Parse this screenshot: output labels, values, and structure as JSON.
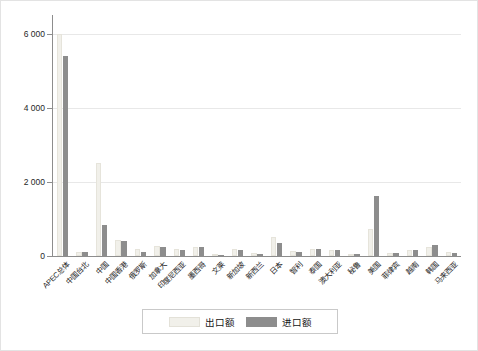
{
  "chart_data": {
    "type": "bar",
    "title": "",
    "xlabel": "",
    "ylabel": "",
    "ylim": [
      0,
      6400
    ],
    "yticks": [
      0,
      2000,
      4000,
      6000
    ],
    "ytick_labels": [
      "0",
      "2 000",
      "4 000",
      "6 000"
    ],
    "grid": true,
    "legend_position": "bottom",
    "categories": [
      "APEC总体",
      "中国台北",
      "中国",
      "中国香港",
      "俄罗斯",
      "加拿大",
      "印度尼西亚",
      "墨西哥",
      "文莱",
      "新加坡",
      "新西兰",
      "日本",
      "智利",
      "泰国",
      "澳大利亚",
      "秘鲁",
      "美国",
      "菲律宾",
      "越南",
      "韩国",
      "马来西亚"
    ],
    "series": [
      {
        "name": "出口额",
        "color": "#f1f0ea",
        "values": [
          6000,
          120,
          2500,
          430,
          200,
          280,
          180,
          250,
          60,
          180,
          80,
          500,
          130,
          200,
          170,
          60,
          720,
          90,
          170,
          240,
          100
        ]
      },
      {
        "name": "进口额",
        "color": "#8d8d8d",
        "values": [
          5400,
          110,
          830,
          400,
          100,
          250,
          160,
          230,
          40,
          160,
          60,
          350,
          100,
          180,
          150,
          50,
          1620,
          80,
          160,
          300,
          80
        ]
      }
    ]
  },
  "legend": {
    "entries": [
      {
        "label": "出口额"
      },
      {
        "label": "进口额"
      }
    ]
  }
}
